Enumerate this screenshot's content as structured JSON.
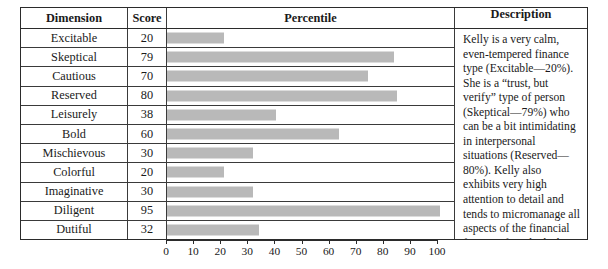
{
  "table": {
    "columns": {
      "dimension": "Dimension",
      "score": "Score",
      "percentile": "Percentile",
      "description": "Description"
    },
    "rows": [
      {
        "dimension": "Excitable",
        "score": 20
      },
      {
        "dimension": "Skeptical",
        "score": 79
      },
      {
        "dimension": "Cautious",
        "score": 70
      },
      {
        "dimension": "Reserved",
        "score": 80
      },
      {
        "dimension": "Leisurely",
        "score": 38
      },
      {
        "dimension": "Bold",
        "score": 60
      },
      {
        "dimension": "Mischievous",
        "score": 30
      },
      {
        "dimension": "Colorful",
        "score": 20
      },
      {
        "dimension": "Imaginative",
        "score": 30
      },
      {
        "dimension": "Diligent",
        "score": 95
      },
      {
        "dimension": "Dutiful",
        "score": 32
      }
    ],
    "description": "Kelly is a very calm, even-tempered finance type (Excitable—20%). She is a “trust, but verify” type of person (Skeptical—79%) who can be a bit intimidating in interpersonal situations (Reserved—80%). Kelly also exhibits very high attention to detail and tends to micromanage all aspects of the financial function for which she is responsible (Diligent—95%)."
  },
  "chart_data": {
    "type": "bar",
    "orientation": "horizontal",
    "title": "Percentile",
    "xlabel": "",
    "ylabel": "Dimension",
    "categories": [
      "Excitable",
      "Skeptical",
      "Cautious",
      "Reserved",
      "Leisurely",
      "Bold",
      "Mischievous",
      "Colorful",
      "Imaginative",
      "Diligent",
      "Dutiful"
    ],
    "values": [
      20,
      79,
      70,
      80,
      38,
      60,
      30,
      20,
      30,
      95,
      32
    ],
    "xlim": [
      0,
      100
    ],
    "xticks": [
      0,
      10,
      20,
      30,
      40,
      50,
      60,
      70,
      80,
      90,
      100
    ],
    "grid": false,
    "legend": false,
    "bar_color": "#b9b9b9"
  },
  "colors": {
    "bar": "#b9b9b9",
    "border": "#2b2b2b",
    "inner_border": "#3a3a3a",
    "text": "#1a1a1a",
    "background": "#ffffff"
  }
}
